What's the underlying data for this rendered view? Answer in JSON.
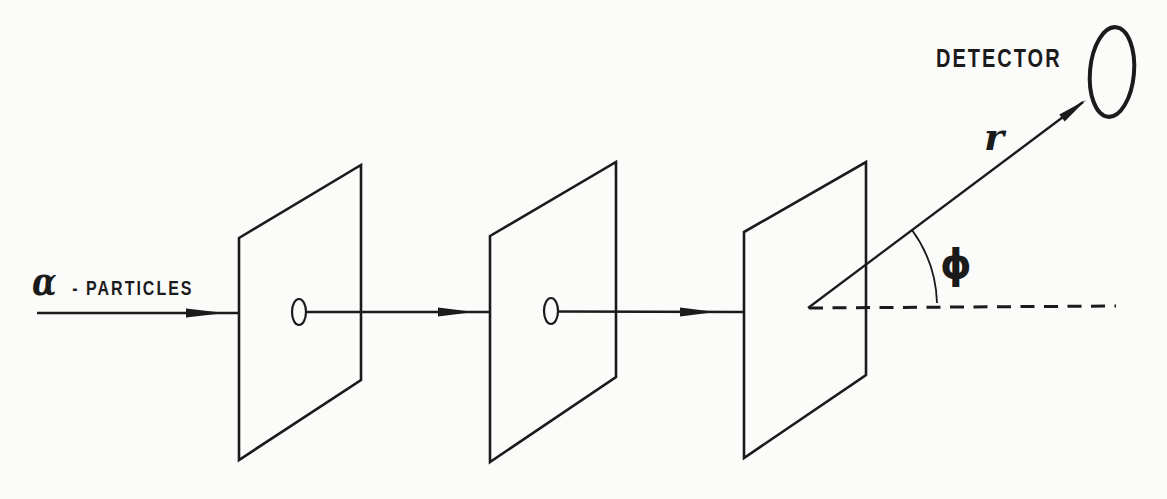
{
  "figure": {
    "ink_color": "#1b1b1b",
    "paper_color": "#fbfbf9",
    "labels": {
      "source_symbol": "α",
      "source_text": "- PARTICLES",
      "detector": "DETECTOR",
      "radius": "r",
      "angle": "ϕ"
    }
  }
}
